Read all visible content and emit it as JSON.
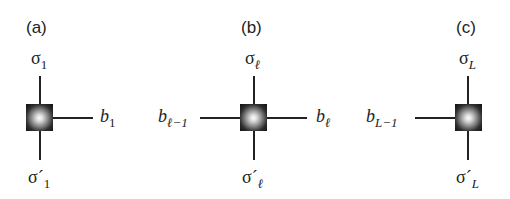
{
  "panels": [
    {
      "id": "a",
      "label": "(a)",
      "top_index": {
        "symbol": "σ",
        "sub": "1"
      },
      "bottom_index": {
        "symbol": "σ´",
        "sub": "1"
      },
      "left_bond": null,
      "right_bond": {
        "symbol": "b",
        "sub": "1"
      }
    },
    {
      "id": "b",
      "label": "(b)",
      "top_index": {
        "symbol": "σ",
        "sub": "ℓ"
      },
      "bottom_index": {
        "symbol": "σ´",
        "sub": "ℓ"
      },
      "left_bond": {
        "symbol": "b",
        "sub": "ℓ−1"
      },
      "right_bond": {
        "symbol": "b",
        "sub": "ℓ"
      }
    },
    {
      "id": "c",
      "label": "(c)",
      "top_index": {
        "symbol": "σ",
        "sub": "L"
      },
      "bottom_index": {
        "symbol": "σ´",
        "sub": "L"
      },
      "left_bond": {
        "symbol": "b",
        "sub": "L−1"
      },
      "right_bond": null
    }
  ],
  "colors": {
    "line": "#222222",
    "node_edge": "#111111",
    "node_center": "#ffffff",
    "background": "#ffffff"
  }
}
